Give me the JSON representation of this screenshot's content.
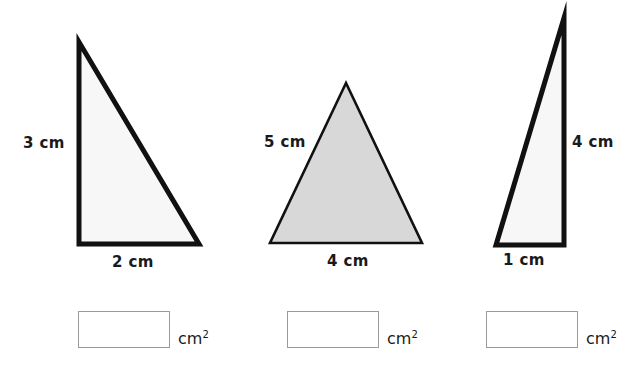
{
  "worksheet": {
    "title": "Find the area of each triangle",
    "unit_label": "cm",
    "unit_exponent": "2"
  },
  "colors": {
    "outline_dark": "#111111",
    "fill_white": "#f7f7f7",
    "fill_gray": "#d8d8d8",
    "box_border": "#9b9b9b",
    "text": "#1a1a1a",
    "background": "#ffffff"
  },
  "figures": [
    {
      "id": "triangle-1",
      "shape": "right-triangle",
      "fill": "#f7f7f7",
      "stroke": "#111111",
      "stroke_width": 5,
      "points": "79,42 79,244 199,244",
      "labels": {
        "height": "3 cm",
        "base": "2 cm"
      }
    },
    {
      "id": "triangle-2",
      "shape": "isosceles-triangle",
      "fill": "#d8d8d8",
      "stroke": "#111111",
      "stroke_width": 2.6,
      "points": "346,83 270,243 422,243",
      "labels": {
        "side": "5 cm",
        "base": "4 cm"
      }
    },
    {
      "id": "triangle-3",
      "shape": "right-triangle",
      "fill": "#f7f7f7",
      "stroke": "#111111",
      "stroke_width": 5,
      "points": "564,18 496,245 564,245",
      "labels": {
        "height": "4 cm",
        "base": "1 cm"
      }
    }
  ],
  "answers": [
    {
      "id": "answer-1",
      "value": "",
      "unit": "cm",
      "exponent": "2"
    },
    {
      "id": "answer-2",
      "value": "",
      "unit": "cm",
      "exponent": "2"
    },
    {
      "id": "answer-3",
      "value": "",
      "unit": "cm",
      "exponent": "2"
    }
  ]
}
